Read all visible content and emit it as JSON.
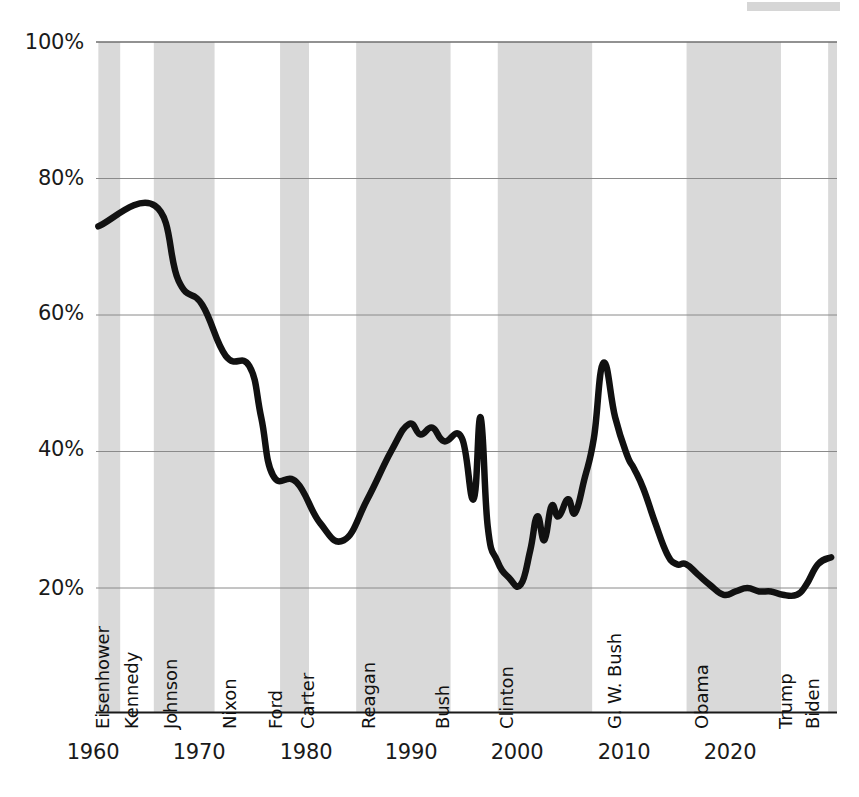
{
  "chart_data": {
    "type": "line",
    "title": "",
    "subtitle": "",
    "xlabel": "",
    "ylabel": "",
    "xlim": [
      1959,
      2021.8
    ],
    "ylim": [
      12,
      100
    ],
    "grid": "horizontal",
    "legend_position": "none",
    "y_ticks": [
      "20%",
      "40%",
      "60%",
      "80%",
      "100%"
    ],
    "y_tick_values": [
      20,
      40,
      60,
      80,
      100
    ],
    "x_ticks": [
      "1960",
      "1970",
      "1980",
      "1990",
      "2000",
      "2010",
      "2020"
    ],
    "x_tick_values": [
      1960,
      1970,
      1980,
      1990,
      2000,
      2010,
      2020
    ],
    "series_name": "Trust in government",
    "line_color": "#111111",
    "band_color": "#d9d9d9",
    "x": [
      1959.2,
      1964.0,
      1966.0,
      1968.0,
      1970.0,
      1972.0,
      1973.0,
      1974.0,
      1976.0,
      1978.0,
      1980.0,
      1982.0,
      1984.0,
      1985.5,
      1986.5,
      1987.5,
      1988.5,
      1990.0,
      1991.0,
      1991.6,
      1992.2,
      1993.0,
      1994.0,
      1995.0,
      1995.8,
      1996.4,
      1997.0,
      1997.6,
      1998.2,
      1999.0,
      1999.6,
      2000.4,
      2001.2,
      2002.0,
      2003.0,
      2004.0,
      2004.6,
      2005.4,
      2006.4,
      2007.4,
      2008.2,
      2009.0,
      2010.0,
      2011.0,
      2012.2,
      2013.2,
      2014.2,
      2015.2,
      2016.2,
      2017.2,
      2018.4,
      2019.2,
      2020.2,
      2021.3
    ],
    "y": [
      73.0,
      76.0,
      65.0,
      61.5,
      54.0,
      52.5,
      45.0,
      36.5,
      35.5,
      29.5,
      27.0,
      33.0,
      40.0,
      44.0,
      42.5,
      43.5,
      41.5,
      42.0,
      33.0,
      45.0,
      29.0,
      24.0,
      21.5,
      20.5,
      25.5,
      30.5,
      27.0,
      32.0,
      30.5,
      33.0,
      31.0,
      36.0,
      42.0,
      53.0,
      45.0,
      39.5,
      37.5,
      34.5,
      29.5,
      25.0,
      23.5,
      23.5,
      22.0,
      20.5,
      19.0,
      19.5,
      20.0,
      19.5,
      19.5,
      19.0,
      19.0,
      20.5,
      23.5,
      24.5
    ],
    "annotations": []
  },
  "axis": {
    "y_labels": [
      "100%",
      "80%",
      "60%",
      "40%",
      "20%"
    ],
    "x_labels": [
      "1960",
      "1970",
      "1980",
      "1990",
      "2000",
      "2010",
      "2020"
    ]
  },
  "presidents": [
    {
      "name": "Eisenhower",
      "start": 1959.2,
      "end": 1961.05,
      "shaded": true,
      "label_x": 113
    },
    {
      "name": "Kennedy",
      "start": 1961.05,
      "end": 1963.9,
      "shaded": false,
      "label_x": 142
    },
    {
      "name": "Johnson",
      "start": 1963.9,
      "end": 1969.05,
      "shaded": true,
      "label_x": 181
    },
    {
      "name": "Nixon",
      "start": 1969.05,
      "end": 1974.6,
      "shaded": false,
      "label_x": 240
    },
    {
      "name": "Ford",
      "start": 1974.6,
      "end": 1977.05,
      "shaded": true,
      "label_x": 286
    },
    {
      "name": "Carter",
      "start": 1977.05,
      "end": 1981.05,
      "shaded": false,
      "label_x": 318
    },
    {
      "name": "Reagan",
      "start": 1981.05,
      "end": 1989.05,
      "shaded": true,
      "label_x": 379
    },
    {
      "name": "Bush",
      "start": 1989.05,
      "end": 1993.05,
      "shaded": false,
      "label_x": 453
    },
    {
      "name": "Clinton",
      "start": 1993.05,
      "end": 2001.05,
      "shaded": true,
      "label_x": 517
    },
    {
      "name": "G. W. Bush",
      "start": 2001.05,
      "end": 2009.05,
      "shaded": false,
      "label_x": 625
    },
    {
      "name": "Obama",
      "start": 2009.05,
      "end": 2017.05,
      "shaded": true,
      "label_x": 712
    },
    {
      "name": "Trump",
      "start": 2017.05,
      "end": 2021.05,
      "shaded": false,
      "label_x": 796
    },
    {
      "name": "Biden",
      "start": 2021.05,
      "end": 2021.8,
      "shaded": true,
      "label_x": 823
    }
  ]
}
